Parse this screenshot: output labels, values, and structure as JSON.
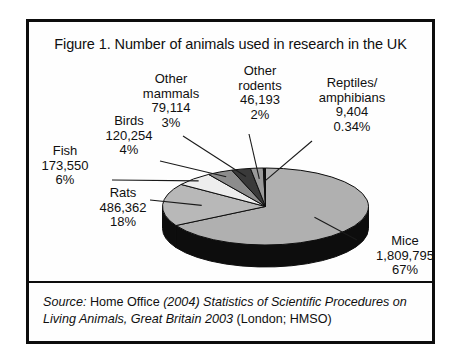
{
  "figure": {
    "title": "Figure 1. Number of animals used in research in the UK",
    "source": {
      "label": "Source:",
      "publisher": "Home Office",
      "work": "(2004) Statistics of Scientific Procedures on",
      "work_line2": "Living Animals, Great Britain 2003",
      "imprint": "(London; HMSO)"
    }
  },
  "chart_data": {
    "type": "pie",
    "title": "Figure 1. Number of animals used in research in the UK",
    "xlabel": "",
    "ylabel": "",
    "legend_position": "none",
    "grid": false,
    "total": 2724672,
    "labels": [
      "Mice",
      "Rats",
      "Fish",
      "Birds",
      "Other mammals",
      "Other rodents",
      "Reptiles/amphibians"
    ],
    "values": [
      1809795,
      486362,
      173550,
      120254,
      79114,
      46193,
      9404
    ],
    "percentages": [
      67,
      18,
      6,
      4,
      3,
      2,
      0.34
    ],
    "slices": [
      {
        "name": "Mice",
        "name_display": "Mice",
        "value": 1809795,
        "value_display": "1,809,795",
        "percent": 67,
        "percent_display": "67%",
        "color": "#b0b0b0",
        "side_color": "#0d0d0d"
      },
      {
        "name": "Rats",
        "name_display": "Rats",
        "value": 486362,
        "value_display": "486,362",
        "percent": 18,
        "percent_display": "18%",
        "color": "#b8b8b8",
        "side_color": "#0d0d0d"
      },
      {
        "name": "Fish",
        "name_display": "Fish",
        "value": 173550,
        "value_display": "173,550",
        "percent": 6,
        "percent_display": "6%",
        "color": "#ededed",
        "side_color": "#0d0d0d"
      },
      {
        "name": "Birds",
        "name_display": "Birds",
        "value": 120254,
        "value_display": "120,254",
        "percent": 4,
        "percent_display": "4%",
        "color": "#8c8c8c",
        "side_color": "#0d0d0d"
      },
      {
        "name": "Other mammals",
        "name_display_line1": "Other",
        "name_display_line2": "mammals",
        "value": 79114,
        "value_display": "79,114",
        "percent": 3,
        "percent_display": "3%",
        "color": "#3a3a3a",
        "side_color": "#0d0d0d"
      },
      {
        "name": "Other rodents",
        "name_display_line1": "Other",
        "name_display_line2": "rodents",
        "value": 46193,
        "value_display": "46,193",
        "percent": 2,
        "percent_display": "2%",
        "color": "#9a9a9a",
        "side_color": "#0d0d0d"
      },
      {
        "name": "Reptiles/amphibians",
        "name_display_line1": "Reptiles/",
        "name_display_line2": "amphibians",
        "value": 9404,
        "value_display": "9,404",
        "percent": 0.34,
        "percent_display": "0.34%",
        "color": "#111111",
        "side_color": "#0d0d0d"
      }
    ]
  },
  "colors": {
    "frame": "#0d0d0d",
    "text": "#101010",
    "background": "#ffffff",
    "leader_line": "#1a1a1a"
  }
}
